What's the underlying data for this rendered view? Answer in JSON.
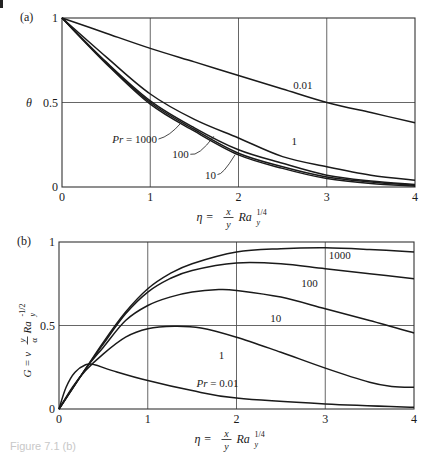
{
  "figure": {
    "caption_fragment": "Figure 7.1 (b)"
  },
  "chart_data": [
    {
      "type": "line",
      "panel_label": "(a)",
      "title": "",
      "xlabel": "η = (x/y) Ra_y^{1/4}",
      "xlabel_parts": {
        "eta": "η =",
        "num": "x",
        "den": "y",
        "ra": "Ra",
        "sub": "y",
        "sup": "1/4"
      },
      "ylabel": "θ",
      "xlim": [
        0,
        4
      ],
      "ylim": [
        0,
        1
      ],
      "xticks": [
        0,
        1,
        2,
        3,
        4
      ],
      "xtick_labels": [
        "0",
        "1",
        "2",
        "3",
        "4"
      ],
      "yticks": [
        0,
        0.5,
        1
      ],
      "ytick_labels": [
        "0",
        "0.5",
        "1"
      ],
      "grid": true,
      "frame": {
        "left": 62,
        "right": 415,
        "top": 18,
        "bottom": 187
      },
      "series": [
        {
          "name": "Pr = 0.01",
          "x": [
            0,
            0.5,
            1,
            1.5,
            2,
            2.5,
            3,
            3.5,
            4
          ],
          "values": [
            1,
            0.91,
            0.82,
            0.74,
            0.66,
            0.58,
            0.5,
            0.44,
            0.38
          ]
        },
        {
          "name": "Pr = 1",
          "x": [
            0,
            0.5,
            1,
            1.5,
            2,
            2.5,
            3,
            3.5,
            4
          ],
          "values": [
            1,
            0.77,
            0.55,
            0.4,
            0.29,
            0.18,
            0.12,
            0.07,
            0.04
          ]
        },
        {
          "name": "Pr = 10",
          "x": [
            0,
            0.5,
            1,
            1.5,
            2,
            2.5,
            3,
            3.5,
            4
          ],
          "values": [
            1,
            0.74,
            0.51,
            0.35,
            0.22,
            0.14,
            0.07,
            0.035,
            0.015
          ]
        },
        {
          "name": "Pr = 100",
          "x": [
            0,
            0.5,
            1,
            1.5,
            2,
            2.5,
            3,
            3.5,
            4
          ],
          "values": [
            1,
            0.735,
            0.5,
            0.34,
            0.2,
            0.12,
            0.06,
            0.03,
            0.01
          ]
        },
        {
          "name": "Pr = 1000",
          "x": [
            0,
            0.5,
            1,
            1.5,
            2,
            2.5,
            3,
            3.5,
            4
          ],
          "values": [
            1,
            0.73,
            0.49,
            0.33,
            0.19,
            0.11,
            0.05,
            0.02,
            0.005
          ]
        }
      ],
      "annotations": [
        {
          "text": "0.01",
          "x": 2.62,
          "y": 0.58
        },
        {
          "text": "1",
          "x": 2.6,
          "y": 0.25
        },
        {
          "text": "Pr = 1000",
          "x": 0.57,
          "y": 0.26,
          "italic_prefix": "Pr",
          "leader": [
            [
              1.22,
              0.3
            ],
            [
              1.35,
              0.38
            ]
          ]
        },
        {
          "text": "100",
          "x": 1.25,
          "y": 0.17,
          "leader": [
            [
              1.55,
              0.18
            ],
            [
              1.72,
              0.3
            ]
          ]
        },
        {
          "text": "10",
          "x": 1.62,
          "y": 0.05,
          "leader": [
            [
              1.82,
              0.07
            ],
            [
              1.96,
              0.19
            ]
          ]
        }
      ]
    },
    {
      "type": "line",
      "panel_label": "(b)",
      "title": "",
      "xlabel": "η = (x/y) Ra_y^{1/4}",
      "xlabel_parts": {
        "eta": "η =",
        "num": "x",
        "den": "y",
        "ra": "Ra",
        "sub": "y",
        "sup": "1/4"
      },
      "ylabel": "G = v (y/α) Ra_y^{-1/2}",
      "ylabel_parts": {
        "lhs": "G = v",
        "num": "y",
        "den": "α",
        "ra": "Ra",
        "sub": "y",
        "sup": "-1/2"
      },
      "xlim": [
        0,
        4
      ],
      "ylim": [
        0,
        1
      ],
      "xticks": [
        0,
        1,
        2,
        3,
        4
      ],
      "xtick_labels": [
        "0",
        "1",
        "2",
        "3",
        "4"
      ],
      "yticks": [
        0,
        0.5,
        1
      ],
      "ytick_labels": [
        "0",
        "0.5",
        "1"
      ],
      "grid": true,
      "frame": {
        "left": 59,
        "right": 414,
        "top": 242,
        "bottom": 409
      },
      "series": [
        {
          "name": "Pr = 0.01",
          "x": [
            0,
            0.08,
            0.18,
            0.3,
            0.4,
            0.6,
            1,
            1.5,
            2,
            3,
            4
          ],
          "values": [
            0,
            0.13,
            0.22,
            0.265,
            0.265,
            0.23,
            0.17,
            0.11,
            0.065,
            0.03,
            0.01
          ]
        },
        {
          "name": "Pr = 1",
          "x": [
            0,
            0.15,
            0.3,
            0.5,
            0.75,
            1,
            1.3,
            1.6,
            2,
            2.5,
            3,
            3.5,
            3.75,
            4
          ],
          "values": [
            0,
            0.13,
            0.23,
            0.33,
            0.43,
            0.48,
            0.495,
            0.485,
            0.43,
            0.34,
            0.245,
            0.16,
            0.135,
            0.13
          ]
        },
        {
          "name": "Pr = 10",
          "x": [
            0,
            0.3,
            0.5,
            0.75,
            1,
            1.25,
            1.5,
            1.8,
            2,
            2.5,
            3,
            3.5,
            4
          ],
          "values": [
            0,
            0.24,
            0.37,
            0.53,
            0.62,
            0.67,
            0.7,
            0.715,
            0.71,
            0.67,
            0.6,
            0.53,
            0.455
          ]
        },
        {
          "name": "Pr = 100",
          "x": [
            0,
            0.3,
            0.5,
            0.75,
            1,
            1.25,
            1.5,
            2,
            2.5,
            3,
            3.5,
            4
          ],
          "values": [
            0,
            0.24,
            0.39,
            0.57,
            0.7,
            0.78,
            0.83,
            0.875,
            0.87,
            0.84,
            0.81,
            0.78
          ]
        },
        {
          "name": "Pr = 1000",
          "x": [
            0,
            0.3,
            0.5,
            0.75,
            1,
            1.25,
            1.5,
            2,
            2.5,
            3,
            3.5,
            4
          ],
          "values": [
            0,
            0.24,
            0.4,
            0.58,
            0.72,
            0.81,
            0.87,
            0.94,
            0.96,
            0.965,
            0.955,
            0.94
          ]
        }
      ],
      "annotations": [
        {
          "text": "1000",
          "x": 3.04,
          "y": 0.9
        },
        {
          "text": "100",
          "x": 2.73,
          "y": 0.73
        },
        {
          "text": "10",
          "x": 2.38,
          "y": 0.52
        },
        {
          "text": "1",
          "x": 1.8,
          "y": 0.3
        },
        {
          "text": "Pr = 0.01",
          "x": 1.55,
          "y": 0.13,
          "italic_prefix": "Pr"
        }
      ]
    }
  ]
}
